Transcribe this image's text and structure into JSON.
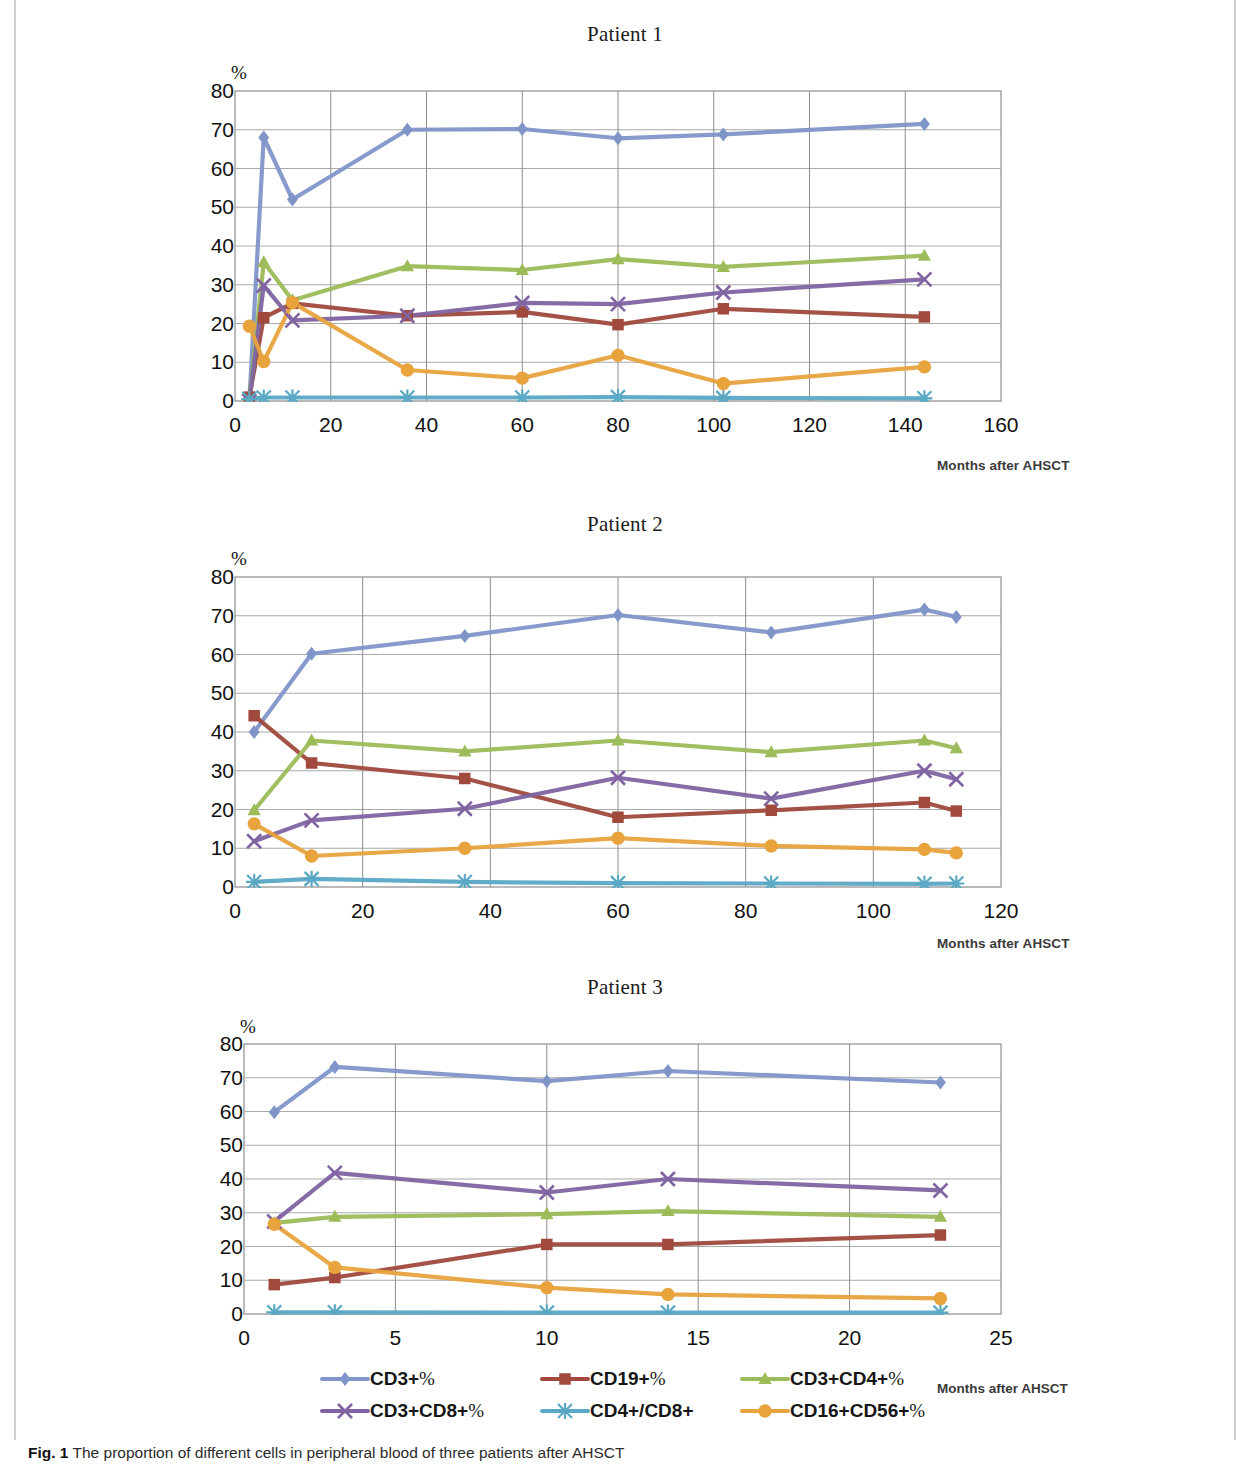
{
  "figure": {
    "caption_label": "Fig. 1",
    "caption_text": "The proportion of different cells in peripheral blood of three patients after AHSCT"
  },
  "axis": {
    "y_unit": "%",
    "x_caption": "Months after AHSCT",
    "y_ticks": [
      80,
      70,
      60,
      50,
      40,
      30,
      20,
      10,
      0
    ]
  },
  "legend": {
    "items": [
      {
        "label": "CD3+%",
        "color": "#7f95c8",
        "marker": "diamond"
      },
      {
        "label": "CD19+%",
        "color": "#a0493c",
        "marker": "square"
      },
      {
        "label": "CD3+CD4+%",
        "color": "#9cbb59",
        "marker": "triangle"
      },
      {
        "label": "CD3+CD8+%",
        "color": "#8064a2",
        "marker": "cross"
      },
      {
        "label": "CD4+/CD8+",
        "color": "#5aa8c4",
        "marker": "asterisk"
      },
      {
        "label": "CD16+CD56+%",
        "color": "#e8a33d",
        "marker": "circle"
      }
    ]
  },
  "chart_data": [
    {
      "type": "line",
      "title": "Patient 1",
      "xlabel": "Months after AHSCT",
      "ylabel": "%",
      "xlim": [
        0,
        160
      ],
      "ylim": [
        0,
        80
      ],
      "xticks": [
        0,
        20,
        40,
        60,
        80,
        100,
        120,
        140,
        160
      ],
      "yticks": [
        0,
        10,
        20,
        30,
        40,
        50,
        60,
        70,
        80
      ],
      "grid": true,
      "legend_position": "bottom-shared",
      "series": [
        {
          "name": "CD3+%",
          "color": "#7f95c8",
          "marker": "diamond",
          "x": [
            3,
            6,
            12,
            36,
            60,
            80,
            102,
            144
          ],
          "y": [
            0,
            68,
            52,
            70,
            70.2,
            67.8,
            68.8,
            71.5
          ]
        },
        {
          "name": "CD19+%",
          "color": "#a0493c",
          "marker": "square",
          "x": [
            3,
            6,
            12,
            36,
            60,
            80,
            102,
            144
          ],
          "y": [
            1,
            21.5,
            25.2,
            22,
            23,
            19.7,
            23.8,
            21.7
          ]
        },
        {
          "name": "CD3+CD4+%",
          "color": "#9cbb59",
          "marker": "triangle",
          "x": [
            3,
            6,
            12,
            36,
            60,
            80,
            102,
            144
          ],
          "y": [
            0,
            35.8,
            26,
            34.8,
            33.8,
            36.6,
            34.6,
            37.5
          ]
        },
        {
          "name": "CD3+CD8+%",
          "color": "#8064a2",
          "marker": "cross",
          "x": [
            3,
            6,
            12,
            36,
            60,
            80,
            102,
            144
          ],
          "y": [
            0,
            29.8,
            20.8,
            22,
            25.3,
            25,
            28,
            31.4
          ]
        },
        {
          "name": "CD4+/CD8+",
          "color": "#5aa8c4",
          "marker": "asterisk",
          "x": [
            3,
            6,
            12,
            36,
            60,
            80,
            102,
            144
          ],
          "y": [
            0.5,
            0.9,
            0.9,
            0.9,
            0.9,
            1.0,
            0.8,
            0.7
          ]
        },
        {
          "name": "CD16+CD56+%",
          "color": "#e8a33d",
          "marker": "circle",
          "x": [
            3,
            6,
            12,
            36,
            60,
            80,
            102,
            144
          ],
          "y": [
            19.3,
            10.2,
            25.4,
            8,
            5.9,
            11.8,
            4.5,
            8.8
          ]
        }
      ]
    },
    {
      "type": "line",
      "title": "Patient 2",
      "xlabel": "Months after AHSCT",
      "ylabel": "%",
      "xlim": [
        0,
        120
      ],
      "ylim": [
        0,
        80
      ],
      "xticks": [
        0,
        20,
        40,
        60,
        80,
        100,
        120
      ],
      "yticks": [
        0,
        10,
        20,
        30,
        40,
        50,
        60,
        70,
        80
      ],
      "grid": true,
      "legend_position": "bottom-shared",
      "series": [
        {
          "name": "CD3+%",
          "color": "#7f95c8",
          "marker": "diamond",
          "x": [
            3,
            12,
            36,
            60,
            84,
            108,
            113
          ],
          "y": [
            40,
            60.2,
            64.8,
            70.2,
            65.7,
            71.6,
            69.7
          ]
        },
        {
          "name": "CD19+%",
          "color": "#a0493c",
          "marker": "square",
          "x": [
            3,
            12,
            36,
            60,
            84,
            108,
            113
          ],
          "y": [
            44.2,
            32,
            28,
            18,
            19.8,
            21.8,
            19.6
          ]
        },
        {
          "name": "CD3+CD4+%",
          "color": "#9cbb59",
          "marker": "triangle",
          "x": [
            3,
            12,
            36,
            60,
            84,
            108,
            113
          ],
          "y": [
            19.8,
            37.8,
            35,
            37.8,
            34.8,
            37.8,
            35.8
          ]
        },
        {
          "name": "CD3+CD8+%",
          "color": "#8064a2",
          "marker": "cross",
          "x": [
            3,
            12,
            36,
            60,
            84,
            108,
            113
          ],
          "y": [
            11.8,
            17.2,
            20.2,
            28.2,
            22.8,
            30,
            27.8
          ]
        },
        {
          "name": "CD4+/CD8+",
          "color": "#5aa8c4",
          "marker": "asterisk",
          "x": [
            3,
            12,
            36,
            60,
            84,
            108,
            113
          ],
          "y": [
            1.3,
            2.1,
            1.3,
            1.0,
            0.9,
            0.8,
            0.9
          ]
        },
        {
          "name": "CD16+CD56+%",
          "color": "#e8a33d",
          "marker": "circle",
          "x": [
            3,
            12,
            36,
            60,
            84,
            108,
            113
          ],
          "y": [
            16.3,
            8,
            10,
            12.6,
            10.6,
            9.7,
            8.8
          ]
        }
      ]
    },
    {
      "type": "line",
      "title": "Patient 3",
      "xlabel": "Months after AHSCT",
      "ylabel": "%",
      "xlim": [
        0,
        25
      ],
      "ylim": [
        0,
        80
      ],
      "xticks": [
        0,
        5,
        10,
        15,
        20,
        25
      ],
      "yticks": [
        0,
        10,
        20,
        30,
        40,
        50,
        60,
        70,
        80
      ],
      "grid": true,
      "legend_position": "bottom-shared",
      "series": [
        {
          "name": "CD3+%",
          "color": "#7f95c8",
          "marker": "diamond",
          "x": [
            1,
            3,
            10,
            14,
            23
          ],
          "y": [
            59.8,
            73.2,
            69,
            72,
            68.6
          ]
        },
        {
          "name": "CD19+%",
          "color": "#a0493c",
          "marker": "square",
          "x": [
            1,
            3,
            10,
            14,
            23
          ],
          "y": [
            8.7,
            10.8,
            20.6,
            20.6,
            23.4
          ]
        },
        {
          "name": "CD3+CD4+%",
          "color": "#9cbb59",
          "marker": "triangle",
          "x": [
            1,
            3,
            10,
            14,
            23
          ],
          "y": [
            27,
            28.8,
            29.6,
            30.5,
            28.8
          ]
        },
        {
          "name": "CD3+CD8+%",
          "color": "#8064a2",
          "marker": "cross",
          "x": [
            1,
            3,
            10,
            14,
            23
          ],
          "y": [
            27.4,
            41.8,
            36,
            40,
            36.6
          ]
        },
        {
          "name": "CD4+/CD8+",
          "color": "#5aa8c4",
          "marker": "asterisk",
          "x": [
            1,
            3,
            10,
            14,
            23
          ],
          "y": [
            0.5,
            0.5,
            0.4,
            0.4,
            0.4
          ]
        },
        {
          "name": "CD16+CD56+%",
          "color": "#e8a33d",
          "marker": "circle",
          "x": [
            1,
            3,
            10,
            14,
            23
          ],
          "y": [
            26.6,
            13.8,
            7.8,
            5.8,
            4.6
          ]
        }
      ]
    }
  ]
}
